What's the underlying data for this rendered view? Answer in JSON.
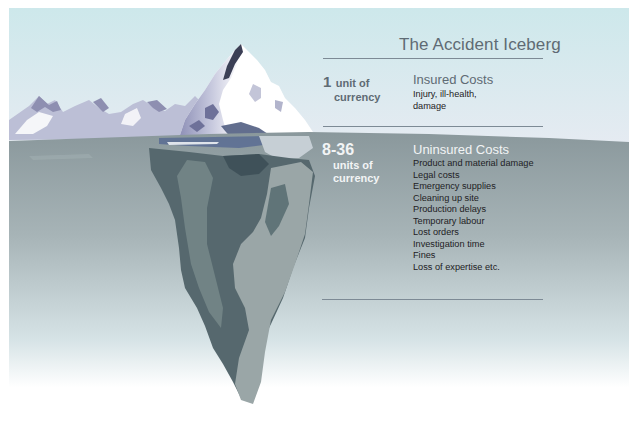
{
  "title": "The Accident Iceberg",
  "insured": {
    "amount": "1",
    "unit_line1": "unit of",
    "unit_line2": "currency",
    "heading": "Insured Costs",
    "items": [
      "Injury, ill-health,",
      "damage"
    ]
  },
  "uninsured": {
    "amount": "8-36",
    "unit_line1": "units of",
    "unit_line2": "currency",
    "heading": "Uninsured Costs",
    "items": [
      "Product and material damage",
      "Legal costs",
      "Emergency supplies",
      "Cleaning up site",
      "Production delays",
      "Temporary labour",
      "Lost orders",
      "Investigation time",
      "Fines",
      "Loss of expertise etc."
    ]
  },
  "colors": {
    "sky_top": "#cfe8ec",
    "sky_bottom": "#e4ebf1",
    "water_top": "#8e9b9f",
    "water_bottom": "#ffffff",
    "rule": "#7d8a95",
    "title_text": "#5f6b74",
    "insured_amount": "#5f6b74",
    "uninsured_text": "#f2f4f5"
  }
}
